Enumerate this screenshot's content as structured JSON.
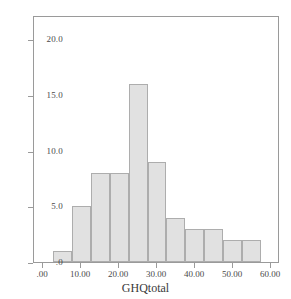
{
  "chart_data": {
    "type": "bar",
    "title": "",
    "subtitle": "",
    "xlabel": "GHQtotal",
    "ylabel": "",
    "xlim": [
      -2.5,
      62.5
    ],
    "ylim": [
      0,
      22.2
    ],
    "grid": false,
    "legend": null,
    "bin_width": 5,
    "x_tick_labels": [
      ".00",
      "10.00",
      "20.00",
      "30.00",
      "40.00",
      "50.00",
      "60.00"
    ],
    "x_tick_values": [
      0,
      10,
      20,
      30,
      40,
      50,
      60
    ],
    "y_tick_labels": [
      ".0",
      "5.0",
      "10.0",
      "15.0",
      "20.0"
    ],
    "y_tick_values": [
      0,
      5,
      10,
      15,
      20
    ],
    "bins": [
      {
        "start": 2.5,
        "end": 7.5,
        "count": 1
      },
      {
        "start": 7.5,
        "end": 12.5,
        "count": 5
      },
      {
        "start": 12.5,
        "end": 17.5,
        "count": 8
      },
      {
        "start": 17.5,
        "end": 22.5,
        "count": 8
      },
      {
        "start": 22.5,
        "end": 27.5,
        "count": 16
      },
      {
        "start": 27.5,
        "end": 32.5,
        "count": 9
      },
      {
        "start": 32.5,
        "end": 37.5,
        "count": 4
      },
      {
        "start": 37.5,
        "end": 42.5,
        "count": 3
      },
      {
        "start": 42.5,
        "end": 47.5,
        "count": 3
      },
      {
        "start": 47.5,
        "end": 52.5,
        "count": 2
      },
      {
        "start": 52.5,
        "end": 57.5,
        "count": 2
      }
    ],
    "categories": [
      "2.5-7.5",
      "7.5-12.5",
      "12.5-17.5",
      "17.5-22.5",
      "22.5-27.5",
      "27.5-32.5",
      "32.5-37.5",
      "37.5-42.5",
      "42.5-47.5",
      "47.5-52.5",
      "52.5-57.5"
    ],
    "values": [
      1,
      5,
      8,
      8,
      16,
      9,
      4,
      3,
      3,
      2,
      2
    ],
    "colors": {
      "bar_fill": "#e1e1e1",
      "bar_border": "#adadad",
      "frame": "#9a9a9a",
      "tick_text": "#4a4a4a",
      "axis_title": "#3a3a3a",
      "background": "#ffffff"
    }
  }
}
